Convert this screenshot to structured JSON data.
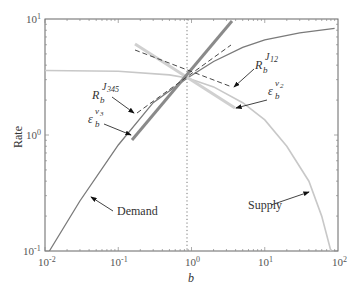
{
  "chart_data": {
    "type": "line",
    "title": "",
    "xlabel": "b",
    "ylabel": "Rate",
    "xscale": "log",
    "yscale": "log",
    "xlim": [
      0.01,
      100
    ],
    "ylim": [
      0.1,
      10
    ],
    "x_ticks": [
      {
        "base": "10",
        "exp": "-2",
        "value": 0.01
      },
      {
        "base": "10",
        "exp": "-1",
        "value": 0.1
      },
      {
        "base": "10",
        "exp": "0",
        "value": 1
      },
      {
        "base": "10",
        "exp": "1",
        "value": 10
      },
      {
        "base": "10",
        "exp": "2",
        "value": 100
      }
    ],
    "y_ticks": [
      {
        "base": "10",
        "exp": "-1",
        "value": 0.1
      },
      {
        "base": "10",
        "exp": "0",
        "value": 1
      },
      {
        "base": "10",
        "exp": "1",
        "value": 10
      }
    ],
    "grid": false,
    "vertical_reference_line": {
      "x": 0.88,
      "style": "dotted"
    },
    "series": [
      {
        "name": "Demand",
        "color": "#777777",
        "style": "solid",
        "points": [
          [
            0.0115,
            0.1
          ],
          [
            0.03,
            0.27
          ],
          [
            0.1,
            0.82
          ],
          [
            0.3,
            1.9
          ],
          [
            0.88,
            3.1
          ],
          [
            2,
            4.3
          ],
          [
            5,
            5.7
          ],
          [
            10,
            6.6
          ],
          [
            30,
            7.6
          ],
          [
            90,
            8.3
          ]
        ]
      },
      {
        "name": "Supply",
        "color": "#c8c8c8",
        "style": "solid",
        "points": [
          [
            0.01,
            3.6
          ],
          [
            0.1,
            3.55
          ],
          [
            0.5,
            3.3
          ],
          [
            0.88,
            3.1
          ],
          [
            2,
            2.6
          ],
          [
            5,
            1.9
          ],
          [
            10,
            1.35
          ],
          [
            20,
            0.8
          ],
          [
            40,
            0.4
          ],
          [
            60,
            0.2
          ],
          [
            80,
            0.1
          ]
        ]
      },
      {
        "name": "epsilon_b^{v3} (demand elasticity tangent)",
        "color": "#888888",
        "style": "thick-solid",
        "points": [
          [
            0.17,
            0.93
          ],
          [
            3.4,
            10
          ]
        ]
      },
      {
        "name": "epsilon_b^{v2} (supply elasticity tangent)",
        "color": "#d0d0d0",
        "style": "thick-solid",
        "points": [
          [
            0.17,
            5.0
          ],
          [
            3.8,
            1.4
          ]
        ]
      },
      {
        "name": "R_b^{J345} (response coefficient)",
        "color": "#333333",
        "style": "dashed",
        "points": [
          [
            0.2,
            1.5
          ],
          [
            3.5,
            6.0
          ]
        ]
      },
      {
        "name": "R_b^{J12} (response coefficient)",
        "color": "#333333",
        "style": "dashed",
        "points": [
          [
            0.18,
            3.9
          ],
          [
            3.6,
            2.3
          ]
        ]
      }
    ],
    "annotations": [
      {
        "text": "Demand",
        "arrow_to": [
          0.036,
          0.33
        ]
      },
      {
        "text": "Supply",
        "arrow_to": [
          55,
          0.24
        ]
      },
      {
        "text": "R_b^{J345}",
        "arrow_to": [
          0.2,
          1.5
        ]
      },
      {
        "text": "epsilon_b^{v3}",
        "arrow_to": [
          0.17,
          0.93
        ]
      },
      {
        "text": "R_b^{J12}",
        "arrow_to": [
          3.6,
          2.3
        ]
      },
      {
        "text": "epsilon_b^{v2}",
        "arrow_to": [
          3.8,
          1.4
        ]
      }
    ]
  },
  "labels": {
    "xlabel": "b",
    "ylabel": "Rate",
    "demand": "Demand",
    "supply": "Supply",
    "R_base": "R",
    "eps_base": "ε",
    "sub_b": "b",
    "sup_J345": "J",
    "sup_J345_sub": "345",
    "sup_J12": "J",
    "sup_J12_sub": "12",
    "sup_v3": "v",
    "sup_v3_sub": "3",
    "sup_v2": "v",
    "sup_v2_sub": "2"
  }
}
